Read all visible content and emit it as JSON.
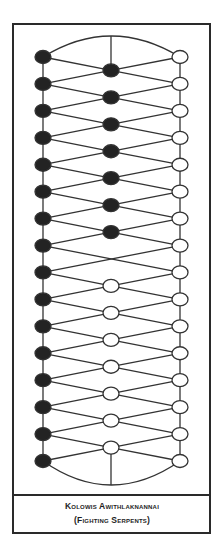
{
  "caption": {
    "title": "Kolowis Awithlaknannai",
    "subtitle": "(Fighting Serpents)"
  },
  "board": {
    "rows": 16,
    "columns": {
      "left_x": 43,
      "middle_x": 111,
      "right_x": 180
    },
    "first_row_y": 57,
    "last_row_y": 461,
    "top_arc_peak_y": 36,
    "bottom_arc_low_y": 485,
    "node_rx": 8,
    "node_ry": 6.5,
    "left_column": [
      "black",
      "black",
      "black",
      "black",
      "black",
      "black",
      "black",
      "black",
      "black",
      "black",
      "black",
      "black",
      "black",
      "black",
      "black",
      "black"
    ],
    "right_column": [
      "white",
      "white",
      "white",
      "white",
      "white",
      "white",
      "white",
      "white",
      "white",
      "white",
      "white",
      "white",
      "white",
      "white",
      "white",
      "white"
    ],
    "middle_column": [
      "black",
      "black",
      "black",
      "black",
      "black",
      "black",
      "black",
      "empty",
      "white",
      "white",
      "white",
      "white",
      "white",
      "white",
      "white"
    ],
    "colors": {
      "line": "#333333",
      "black_piece": "#232323",
      "white_piece": "#ffffff",
      "frame": "#2a2a2a"
    }
  }
}
